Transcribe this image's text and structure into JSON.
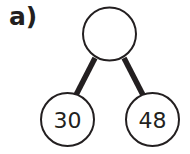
{
  "question_label": "a)",
  "part_whole": {
    "whole": {
      "value": ""
    },
    "parts": [
      {
        "value": "30"
      },
      {
        "value": "48"
      }
    ]
  },
  "colors": {
    "ink": "#231f20",
    "background": "#ffffff"
  }
}
